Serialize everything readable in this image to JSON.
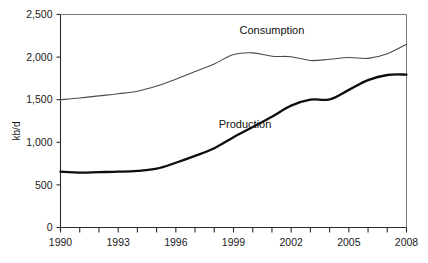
{
  "chart_data": {
    "type": "line",
    "title": "",
    "subtitle": "",
    "xlabel": "",
    "ylabel": "kb/d",
    "xlim": [
      1990,
      2008
    ],
    "ylim": [
      0,
      2500
    ],
    "grid": false,
    "legend_position": "inline-annotations",
    "y_ticks": [
      0,
      500,
      1000,
      1500,
      2000,
      2500
    ],
    "y_tick_labels": [
      "0",
      "500",
      "1,000",
      "1,500",
      "2,000",
      "2,500"
    ],
    "x_ticks": [
      1990,
      1991,
      1992,
      1993,
      1994,
      1995,
      1996,
      1997,
      1998,
      1999,
      2000,
      2001,
      2002,
      2003,
      2004,
      2005,
      2006,
      2007,
      2008
    ],
    "x_tick_labels_shown": [
      "1990",
      "1993",
      "1996",
      "1999",
      "2002",
      "2005",
      "2008"
    ],
    "x": [
      1990,
      1991,
      1992,
      1993,
      1994,
      1995,
      1996,
      1997,
      1998,
      1999,
      2000,
      2001,
      2002,
      2003,
      2004,
      2005,
      2006,
      2007,
      2008
    ],
    "series": [
      {
        "name": "Consumption",
        "style": "thin",
        "color": "#4a4a4a",
        "values": [
          1500,
          1520,
          1545,
          1570,
          1600,
          1660,
          1740,
          1830,
          1920,
          2030,
          2050,
          2010,
          2005,
          1960,
          1975,
          1995,
          1985,
          2040,
          2150
        ]
      },
      {
        "name": "Production",
        "style": "thick",
        "color": "#0d0d0d",
        "values": [
          655,
          645,
          650,
          655,
          665,
          690,
          760,
          840,
          930,
          1060,
          1180,
          1300,
          1430,
          1500,
          1505,
          1615,
          1730,
          1790,
          1795
        ]
      }
    ],
    "annotations": [
      {
        "text": "Consumption",
        "x": 2001.0,
        "y": 2270
      },
      {
        "text": "Production",
        "x": 1999.6,
        "y": 1170
      }
    ]
  }
}
